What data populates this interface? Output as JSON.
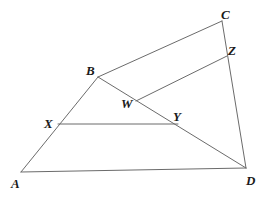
{
  "figure": {
    "background_color": "#ffffff",
    "line_color": "#6b6b6b",
    "label_color": "#1a1a1a",
    "width": 266,
    "height": 198
  },
  "points": {
    "A": {
      "label": "A",
      "x": 21,
      "y": 172,
      "label_x": 11,
      "label_y": 177
    },
    "B": {
      "label": "B",
      "x": 98,
      "y": 77,
      "label_x": 86,
      "label_y": 64
    },
    "C": {
      "label": "C",
      "x": 222,
      "y": 21,
      "label_x": 221,
      "label_y": 8
    },
    "D": {
      "label": "D",
      "x": 246,
      "y": 168,
      "label_x": 246,
      "label_y": 174
    },
    "W": {
      "label": "W",
      "x": 136,
      "y": 101,
      "label_x": 121,
      "label_y": 97
    },
    "X": {
      "label": "X",
      "x": 58,
      "y": 124,
      "label_x": 44,
      "label_y": 117
    },
    "Y": {
      "label": "Y",
      "x": 178,
      "y": 124,
      "label_x": 173,
      "label_y": 110
    },
    "Z": {
      "label": "Z",
      "x": 227,
      "y": 56,
      "label_x": 228,
      "label_y": 44
    }
  },
  "segments": [
    {
      "name": "segment-AB",
      "from": "A",
      "to": "B",
      "d": "M 21 172 L 98 77"
    },
    {
      "name": "segment-BC",
      "from": "B",
      "to": "C",
      "d": "M 98 77 L 222 21"
    },
    {
      "name": "segment-CD",
      "from": "C",
      "to": "D",
      "d": "M 222 21 L 246 168"
    },
    {
      "name": "segment-AD",
      "from": "A",
      "to": "D",
      "d": "M 21 172 L 246 168"
    },
    {
      "name": "segment-BD",
      "from": "B",
      "to": "D",
      "d": "M 98 77 L 246 168"
    },
    {
      "name": "segment-XY",
      "from": "X",
      "to": "Y",
      "d": "M 58 124 L 178 124"
    },
    {
      "name": "segment-WZ",
      "from": "W",
      "to": "Z",
      "d": "M 136 101 L 227 56"
    }
  ],
  "labels_order": [
    "C",
    "Z",
    "B",
    "W",
    "X",
    "Y",
    "A",
    "D"
  ]
}
